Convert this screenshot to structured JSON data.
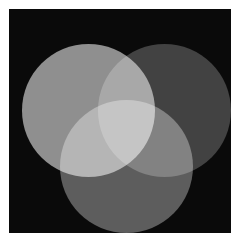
{
  "figure": {
    "canvas": {
      "background_color": "#0a0a0a",
      "page_background_color": "#ffffff",
      "width": 222,
      "height": 224
    }
  },
  "chart_data": {
    "type": "venn",
    "subtitle": "",
    "xlabel": "",
    "ylabel": "",
    "grid": false,
    "legend_position": "none",
    "background_color": "#0a0a0a",
    "blend_mode": "screen",
    "sets": [
      {
        "name": "left",
        "label": "",
        "color": "#8a8a8a",
        "center_x": 79,
        "center_y": 101,
        "radius": 66
      },
      {
        "name": "right",
        "label": "",
        "color": "#3a3a3a",
        "center_x": 155,
        "center_y": 101,
        "radius": 66
      },
      {
        "name": "bottom",
        "label": "",
        "color": "#565656",
        "center_x": 117,
        "center_y": 157,
        "radius": 66
      }
    ],
    "regions": [
      {
        "name": "left-only",
        "color": "#8a8a8a",
        "gray_value": 138
      },
      {
        "name": "right-only",
        "color": "#3a3a3a",
        "gray_value": 58
      },
      {
        "name": "bottom-only",
        "color": "#565656",
        "gray_value": 86
      },
      {
        "name": "left-and-right",
        "color": "#b4b4b4",
        "gray_value": 180
      },
      {
        "name": "left-and-bottom",
        "color": "#e0e0e0",
        "gray_value": 224
      },
      {
        "name": "right-and-bottom",
        "color": "#6e6e6e",
        "gray_value": 110
      },
      {
        "name": "all-three",
        "color": "#ffffff",
        "gray_value": 255
      },
      {
        "name": "background",
        "color": "#0a0a0a",
        "gray_value": 10
      }
    ]
  }
}
